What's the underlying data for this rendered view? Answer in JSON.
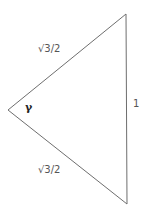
{
  "diagram": {
    "type": "triangle",
    "vertices": {
      "top": [
        126,
        14
      ],
      "left": [
        8,
        110
      ],
      "bottom": [
        127,
        204
      ]
    },
    "line_color": "#6e6e6e",
    "labels": {
      "upper_side": "√3/2",
      "lower_side": "√3/2",
      "right_side": "1",
      "angle": "γ"
    }
  }
}
